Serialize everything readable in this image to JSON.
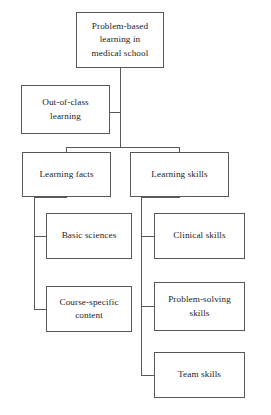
{
  "diagram": {
    "type": "hierarchy-tree",
    "title": "Problem-based learning in medical school",
    "canvas": {
      "width": 271,
      "height": 415
    },
    "colors": {
      "background": "#ffffff",
      "box_border": "#58585a",
      "connector": "#58585a",
      "text": "#1c1c1c"
    },
    "nodes": {
      "root": {
        "label": "Problem-based\nlearning in\nmedical school",
        "level": 0
      },
      "out_of_class": {
        "label": "Out-of-class\nlearning",
        "level": 1
      },
      "learning_facts": {
        "label": "Learning facts",
        "level": 2
      },
      "learning_skills": {
        "label": "Learning skills",
        "level": 2
      },
      "basic_sciences": {
        "label": "Basic sciences",
        "level": 3
      },
      "course_specific": {
        "label": "Course-specific\ncontent",
        "level": 3
      },
      "clinical_skills": {
        "label": "Clinical skills",
        "level": 3
      },
      "problem_solving": {
        "label": "Problem-solving\nskills",
        "level": 3
      },
      "team_skills": {
        "label": "Team skills",
        "level": 3
      }
    },
    "edges": [
      {
        "from": "root",
        "to": "out_of_class"
      },
      {
        "from": "root",
        "to": "learning_facts"
      },
      {
        "from": "root",
        "to": "learning_skills"
      },
      {
        "from": "learning_facts",
        "to": "basic_sciences"
      },
      {
        "from": "learning_facts",
        "to": "course_specific"
      },
      {
        "from": "learning_skills",
        "to": "clinical_skills"
      },
      {
        "from": "learning_skills",
        "to": "problem_solving"
      },
      {
        "from": "learning_skills",
        "to": "team_skills"
      }
    ]
  }
}
